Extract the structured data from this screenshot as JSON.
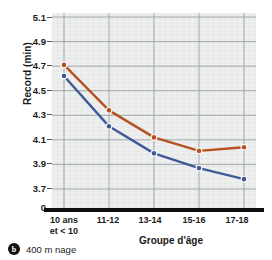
{
  "chart_data": {
    "type": "line",
    "title": "",
    "xlabel": "Groupe d'âge",
    "ylabel": "Record (min)",
    "categories": [
      "10 ans et < 10",
      "11-12",
      "13-14",
      "15-16",
      "17-18"
    ],
    "category_lines": [
      [
        "10 ans",
        "et < 10"
      ],
      [
        "11-12",
        ""
      ],
      [
        "13-14",
        ""
      ],
      [
        "15-16",
        ""
      ],
      [
        "17-18",
        ""
      ]
    ],
    "yticks": [
      "5.1",
      "4.9",
      "4.7",
      "4.5",
      "4.3",
      "4.1",
      "3.9",
      "3.7",
      "0"
    ],
    "ytick_values": [
      5.1,
      4.9,
      4.7,
      4.5,
      4.3,
      4.1,
      3.9,
      3.7,
      0
    ],
    "ylim": [
      3.6,
      5.1
    ],
    "grid": true,
    "legend": "none",
    "axis_break": true,
    "series": [
      {
        "name": "serie-rouge",
        "color": "#b5521f",
        "values": [
          4.71,
          4.34,
          4.12,
          4.01,
          4.04
        ]
      },
      {
        "name": "serie-bleue",
        "color": "#3f5a96",
        "values": [
          4.62,
          4.21,
          3.99,
          3.87,
          3.78
        ]
      }
    ]
  },
  "caption": {
    "badge": "b",
    "text": "400 m nage"
  },
  "colors": {
    "plot_background": "#e9eaea",
    "axis": "#0d0d0d",
    "gridline": "#9aa0a3"
  }
}
